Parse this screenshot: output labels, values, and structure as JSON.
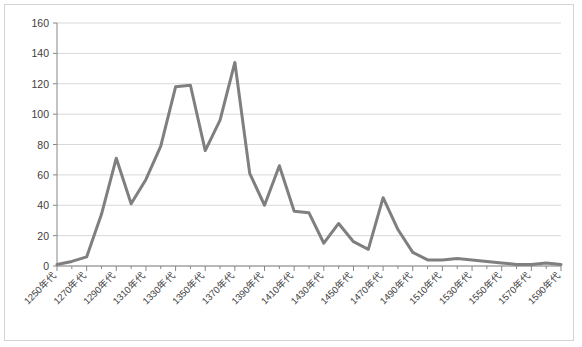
{
  "chart_data": {
    "type": "line",
    "title": "",
    "subtitle": "",
    "xlabel": "",
    "ylabel": "",
    "ylim": [
      0,
      160
    ],
    "ytick_labels": [
      "0",
      "20",
      "40",
      "60",
      "80",
      "100",
      "120",
      "140",
      "160"
    ],
    "ytick_values": [
      0,
      20,
      40,
      60,
      80,
      100,
      120,
      140,
      160
    ],
    "grid": true,
    "grid_axis": "y",
    "legend": false,
    "legend_position": "none",
    "x_tick_label_rotation": -45,
    "x_tick_label_interval": 2,
    "categories": [
      "1250年代",
      "1260年代",
      "1270年代",
      "1280年代",
      "1290年代",
      "1300年代",
      "1310年代",
      "1320年代",
      "1330年代",
      "1340年代",
      "1350年代",
      "1360年代",
      "1370年代",
      "1380年代",
      "1390年代",
      "1400年代",
      "1410年代",
      "1420年代",
      "1430年代",
      "1440年代",
      "1450年代",
      "1460年代",
      "1470年代",
      "1480年代",
      "1490年代",
      "1500年代",
      "1510年代",
      "1520年代",
      "1530年代",
      "1540年代",
      "1550年代",
      "1560年代",
      "1570年代",
      "1580年代",
      "1590年代"
    ],
    "visible_tick_labels": [
      "1250年代",
      "1270年代",
      "1290年代",
      "1310年代",
      "1330年代",
      "1350年代",
      "1370年代",
      "1390年代",
      "1410年代",
      "1430年代",
      "1450年代",
      "1470年代",
      "1490年代",
      "1510年代",
      "1530年代",
      "1550年代",
      "1570年代",
      "1590年代"
    ],
    "values": [
      1,
      3,
      6,
      34,
      71,
      41,
      57,
      79,
      118,
      119,
      76,
      96,
      134,
      61,
      40,
      66,
      36,
      35,
      15,
      28,
      16,
      11,
      45,
      24,
      9,
      4,
      4,
      5,
      4,
      3,
      2,
      1,
      1,
      2,
      1
    ],
    "series": [
      {
        "name": "件数",
        "color": "#7f7f7f",
        "line_width": 3,
        "marker": "none",
        "values": [
          1,
          3,
          6,
          34,
          71,
          41,
          57,
          79,
          118,
          119,
          76,
          96,
          134,
          61,
          40,
          66,
          36,
          35,
          15,
          28,
          16,
          11,
          45,
          24,
          9,
          4,
          4,
          5,
          4,
          3,
          2,
          1,
          1,
          2,
          1
        ]
      }
    ],
    "colors": {
      "line": "#7f7f7f",
      "grid": "#d9d9d9",
      "axis": "#868686",
      "frame": "#d4d4d4",
      "text": "#404040",
      "background": "#ffffff"
    }
  }
}
